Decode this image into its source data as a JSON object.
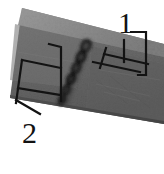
{
  "figure": {
    "type": "micrograph-annotated-specimen",
    "background_color": "#ffffff",
    "annotation_line_color": "#141414",
    "specimen": {
      "top_bevel_color": "#8e8e8e",
      "face_color_light": "#787878",
      "face_color_mid": "#6a6a6a",
      "face_color_dark": "#575757",
      "bottom_edge_color": "#4a4a4a",
      "weld_bead_color": "#1c1c1c"
    },
    "callouts": [
      {
        "id": "callout-1",
        "label": "1",
        "label_x": 118,
        "label_y": 8,
        "points_to": "weld-seam-zone-right-bracket"
      },
      {
        "id": "callout-2",
        "label": "2",
        "label_x": 22,
        "label_y": 118,
        "points_to": "base-metal-zone-left-bracket"
      }
    ],
    "weld_pores": {
      "count": 6,
      "orientation": "diagonal-down-left"
    }
  }
}
